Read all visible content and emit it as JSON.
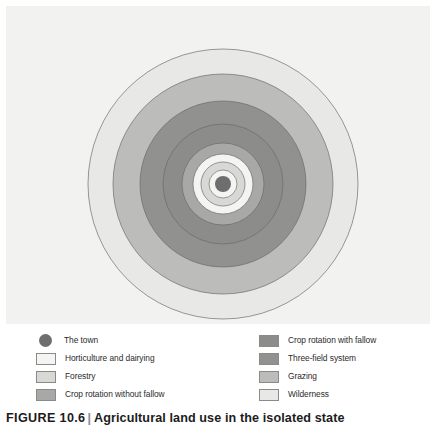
{
  "figure": {
    "number": "FIGURE 10.6",
    "separator": "|",
    "title": "Agricultural land use in the isolated state"
  },
  "colors": {
    "panel_background": "#f2f2f0",
    "town": "#6e6e6e",
    "horticulture_and_dairying": "#f4f4f2",
    "forestry": "#d8d8d4",
    "crop_rotation_without_fallow": "#a8a8a6",
    "crop_rotation_with_fallow": "#8c8c8a",
    "three_field_system": "#919190",
    "grazing": "#bcbcba",
    "wilderness": "#e8e8e6",
    "outline": "#6a6a6a"
  },
  "chart_data": {
    "type": "pie",
    "subtype": "concentric-rings",
    "title": "Agricultural land use in the isolated state",
    "center": {
      "x": 217,
      "y": 178
    },
    "rings": [
      {
        "name": "Wilderness",
        "outer_radius": 135,
        "inner_radius": 110,
        "color": "#e8e8e6"
      },
      {
        "name": "Grazing",
        "outer_radius": 110,
        "inner_radius": 83,
        "color": "#bcbcba"
      },
      {
        "name": "Three-field system",
        "outer_radius": 83,
        "inner_radius": 60,
        "color": "#919190"
      },
      {
        "name": "Crop rotation with fallow",
        "outer_radius": 60,
        "inner_radius": 41,
        "color": "#8c8c8a"
      },
      {
        "name": "Crop rotation without fallow",
        "outer_radius": 41,
        "inner_radius": 30,
        "color": "#a8a8a6"
      },
      {
        "name": "Horticulture and dairying",
        "outer_radius": 30,
        "inner_radius": 22,
        "color": "#f4f4f2"
      },
      {
        "name": "Forestry",
        "outer_radius": 22,
        "inner_radius": 14,
        "color": "#d8d8d4"
      },
      {
        "name": "Horticulture and dairying",
        "outer_radius": 14,
        "inner_radius": 8,
        "color": "#f4f4f2"
      },
      {
        "name": "The town",
        "outer_radius": 8,
        "inner_radius": 0,
        "color": "#6e6e6e"
      }
    ]
  },
  "legend": {
    "left_column": [
      {
        "label": "The town",
        "swatch": "town-dot",
        "color": "#6e6e6e",
        "shape": "circle"
      },
      {
        "label": "Horticulture and dairying",
        "swatch": "horticulture-swatch",
        "color": "#f4f4f2",
        "shape": "rect"
      },
      {
        "label": "Forestry",
        "swatch": "forestry-swatch",
        "color": "#d8d8d4",
        "shape": "rect"
      },
      {
        "label": "Crop rotation without fallow",
        "swatch": "crop-rotation-no-fallow-swatch",
        "color": "#a8a8a6",
        "shape": "rect"
      }
    ],
    "right_column": [
      {
        "label": "Crop rotation with fallow",
        "swatch": "crop-rotation-with-fallow-swatch",
        "color": "#8c8c8a",
        "shape": "rect"
      },
      {
        "label": "Three-field system",
        "swatch": "three-field-swatch",
        "color": "#919190",
        "shape": "rect"
      },
      {
        "label": "Grazing",
        "swatch": "grazing-swatch",
        "color": "#bcbcba",
        "shape": "rect"
      },
      {
        "label": "Wilderness",
        "swatch": "wilderness-swatch",
        "color": "#e8e8e6",
        "shape": "rect"
      }
    ]
  }
}
